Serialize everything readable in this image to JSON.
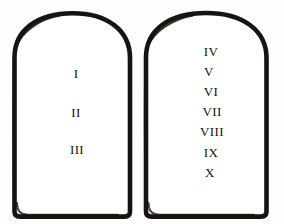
{
  "illustration": {
    "title": "Ten Commandments Tablets",
    "background_color": "#fdfdfc",
    "ink_color": "#15130f"
  },
  "tablets": [
    {
      "id": "left-tablet",
      "name": "first-tablet",
      "numerals": [
        "I",
        "II",
        "III"
      ]
    },
    {
      "id": "right-tablet",
      "name": "second-tablet",
      "numerals": [
        "IV",
        "V",
        "VI",
        "VII",
        "VIII",
        "IX",
        "X"
      ]
    }
  ]
}
